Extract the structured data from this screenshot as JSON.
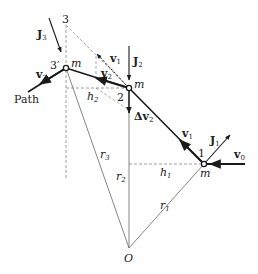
{
  "diagram": {
    "points": {
      "point_1": "1",
      "point_2": "2",
      "point_3": "3",
      "point_3_prime": "3′",
      "origin": "O"
    },
    "mass_label": "m",
    "path_label": "Path",
    "vectors": {
      "v0": {
        "base": "v",
        "sub": "0"
      },
      "v1": {
        "base": "v",
        "sub": "1"
      },
      "v1_ghost": {
        "base": "v",
        "sub": "1"
      },
      "v2": {
        "base": "v",
        "sub": "2"
      },
      "v3": {
        "base": "v",
        "sub": "3"
      },
      "dv2": {
        "base": "Δv",
        "sub": "2"
      },
      "J1": {
        "base": "J",
        "sub": "1"
      },
      "J2": {
        "base": "J",
        "sub": "2"
      },
      "J3": {
        "base": "J",
        "sub": "3"
      }
    },
    "distances": {
      "r1": {
        "base": "r",
        "sub": "1"
      },
      "r2": {
        "base": "r",
        "sub": "2"
      },
      "r3": {
        "base": "r",
        "sub": "3"
      },
      "h1": {
        "base": "h",
        "sub": "1"
      },
      "h2": {
        "base": "h",
        "sub": "2"
      }
    },
    "colors": {
      "ink": "#1a1a1a",
      "thin": "#555555",
      "dashed": "#777777"
    }
  }
}
